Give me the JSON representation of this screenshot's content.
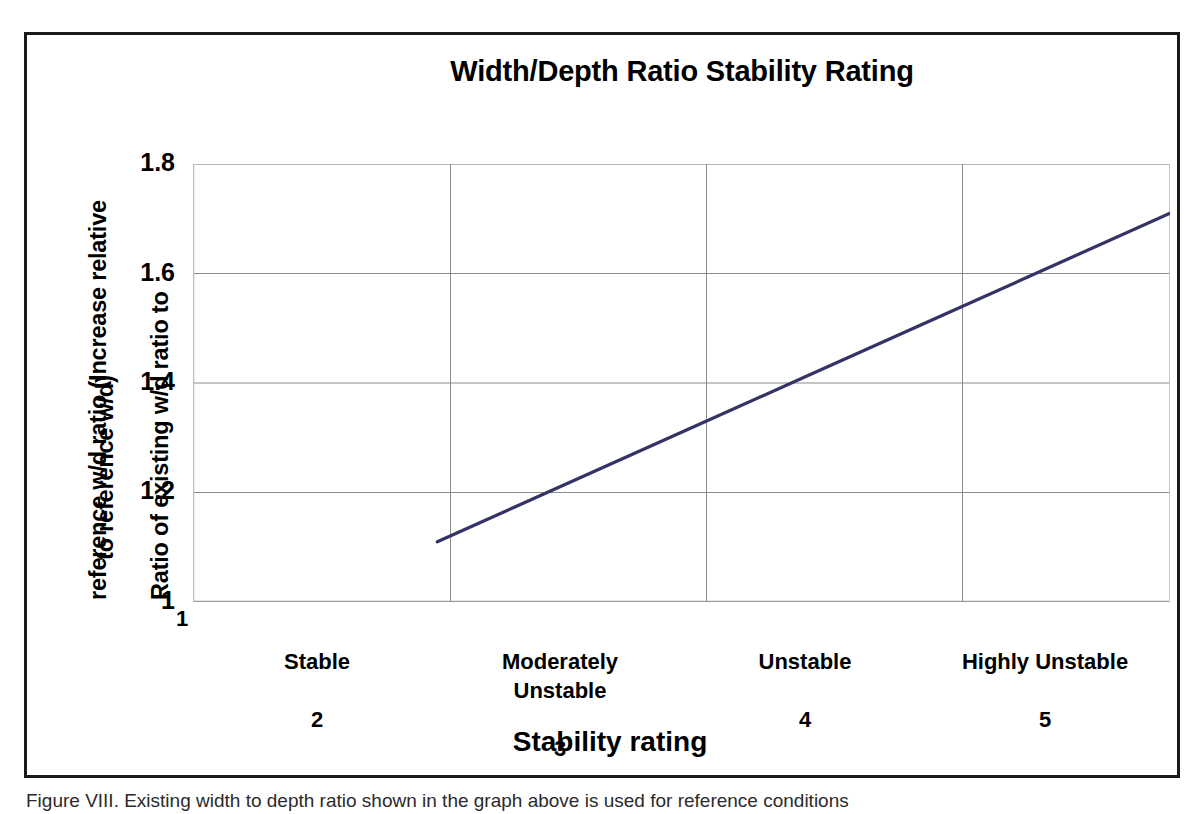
{
  "figure": {
    "caption": "Figure VIII. Existing width to depth ratio shown in the graph above is used for reference conditions"
  },
  "chart_data": {
    "type": "line",
    "title": "Width/Depth Ratio Stability Rating",
    "xlabel": "Stability rating",
    "ylabel_line1": "Ratio of existing w/d ratio to",
    "ylabel_line2": "reference w/d ratio (Increase relative",
    "ylabel_line3": "to reference w/d)",
    "x": [
      2,
      5
    ],
    "values": [
      1.11,
      1.71
    ],
    "series": [
      {
        "name": "Width/depth ratio stability rating",
        "points": [
          {
            "x": 2,
            "y": 1.11
          },
          {
            "x": 3,
            "y": 1.31
          },
          {
            "x": 3.5,
            "y": 1.41
          },
          {
            "x": 4,
            "y": 1.51
          },
          {
            "x": 4.5,
            "y": 1.61
          },
          {
            "x": 5,
            "y": 1.71
          }
        ],
        "color": "#333366"
      }
    ],
    "xlim": [
      1,
      5
    ],
    "ylim": [
      1,
      1.8
    ],
    "y_ticks": [
      "1",
      "1.2",
      "1.4",
      "1.6",
      "1.8"
    ],
    "y_tick_values": [
      1,
      1.2,
      1.4,
      1.6,
      1.8
    ],
    "x_ticks": [
      1,
      2,
      3,
      4,
      5
    ],
    "x_origin_label": "1",
    "x_categories": [
      {
        "number": "2",
        "label": "Stable",
        "x": 2
      },
      {
        "number": "3",
        "label": "Moderately\nUnstable",
        "x": 3
      },
      {
        "number": "4",
        "label": "Unstable",
        "x": 4
      },
      {
        "number": "5",
        "label": "Highly Unstable",
        "x": 5
      }
    ],
    "grid": true,
    "legend": "none",
    "gridline_color": "#9a9a9a",
    "axis_color": "#808080",
    "plot_background": "#ffffff"
  }
}
